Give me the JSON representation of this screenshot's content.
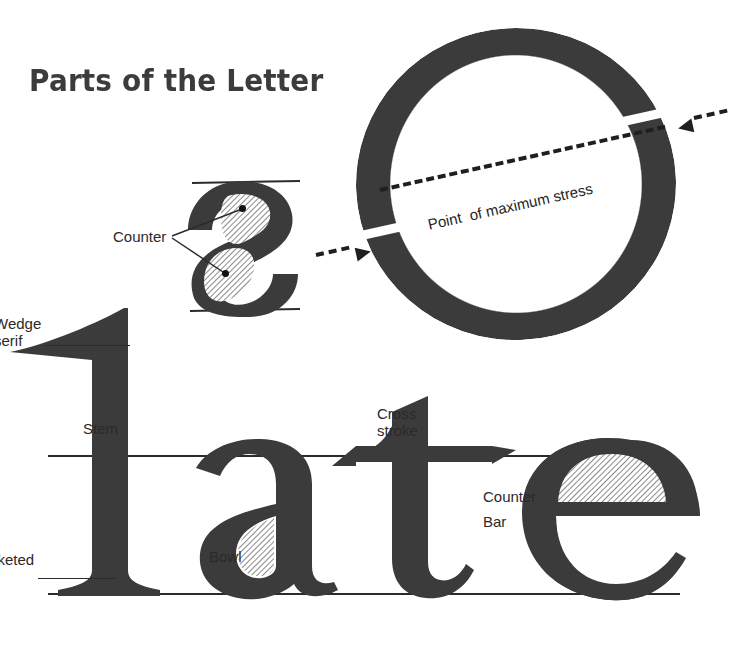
{
  "page": {
    "title": "Parts of the Letter",
    "background_color": "#ffffff",
    "ink_color": "#3a3a3a",
    "label_color": "#2a2a2a"
  },
  "diagrams": {
    "o_diagram": {
      "glyph": "O",
      "stress_label": "Point  of maximum stress",
      "arrow_count": 2,
      "line_style": "dashed",
      "angle_degrees": -12.5
    },
    "s_diagram": {
      "glyph": "s",
      "counter_label": "Counter",
      "counter_count": 2,
      "rules": [
        "x-height",
        "baseline"
      ]
    },
    "word_diagram": {
      "word": "1ate",
      "labels": {
        "wedge_serif_line1": "Wedge",
        "wedge_serif_line2": "serif",
        "stem": "Stem",
        "cross_stroke_line1": "Cross",
        "cross_stroke_line2": "stroke",
        "bowl": "Bowl",
        "counter": "Counter",
        "bar": "Bar",
        "bracketed_serif_line1": "cketed",
        "bracketed_serif_line2": "f"
      },
      "guides": [
        "x-height line",
        "baseline"
      ]
    }
  }
}
